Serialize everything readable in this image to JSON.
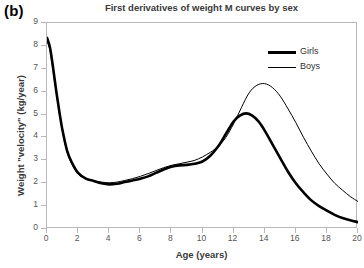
{
  "panel": {
    "label": "(b)"
  },
  "chart_data": {
    "type": "line",
    "title": "First derivatives of weight M curves by sex",
    "xlabel": "Age (years)",
    "ylabel": "Weight \"velocity\" (kg/year)",
    "xlim": [
      0,
      20
    ],
    "ylim": [
      0,
      9
    ],
    "xticks": [
      0,
      2,
      4,
      6,
      8,
      10,
      12,
      14,
      16,
      18,
      20
    ],
    "yticks": [
      0,
      1,
      2,
      3,
      4,
      5,
      6,
      7,
      8,
      9
    ],
    "grid": false,
    "legend_position": "top-right",
    "series": [
      {
        "name": "Girls",
        "color": "#000000",
        "linewidth": 2.6,
        "peak_age": 12.8,
        "peak_value": 5.05,
        "x": [
          0,
          0.2,
          0.4,
          0.6,
          0.8,
          1.0,
          1.3,
          1.6,
          2.0,
          2.5,
          3.0,
          3.5,
          4.0,
          4.5,
          5.0,
          5.5,
          6.0,
          6.5,
          7.0,
          7.5,
          8.0,
          8.5,
          9.0,
          9.5,
          10.0,
          10.5,
          11.0,
          11.5,
          12.0,
          12.4,
          12.8,
          13.2,
          13.6,
          14.0,
          14.5,
          15.0,
          15.5,
          16.0,
          16.5,
          17.0,
          17.5,
          18.0,
          18.5,
          19.0,
          19.5,
          20.0
        ],
        "y": [
          8.35,
          7.9,
          7.0,
          6.0,
          5.1,
          4.3,
          3.4,
          2.9,
          2.45,
          2.2,
          2.1,
          2.0,
          1.95,
          1.98,
          2.05,
          2.12,
          2.2,
          2.3,
          2.45,
          2.6,
          2.72,
          2.78,
          2.8,
          2.85,
          2.95,
          3.2,
          3.6,
          4.15,
          4.7,
          4.95,
          5.05,
          4.95,
          4.7,
          4.3,
          3.7,
          3.1,
          2.5,
          2.0,
          1.6,
          1.25,
          1.0,
          0.8,
          0.62,
          0.48,
          0.38,
          0.3
        ]
      },
      {
        "name": "Boys",
        "color": "#000000",
        "linewidth": 1.0,
        "peak_age": 14.0,
        "peak_value": 6.35,
        "x": [
          0,
          0.2,
          0.4,
          0.6,
          0.8,
          1.0,
          1.3,
          1.6,
          2.0,
          2.5,
          3.0,
          3.5,
          4.0,
          4.5,
          5.0,
          5.5,
          6.0,
          6.5,
          7.0,
          7.5,
          8.0,
          8.5,
          9.0,
          9.5,
          10.0,
          10.5,
          11.0,
          11.5,
          12.0,
          12.5,
          13.0,
          13.5,
          14.0,
          14.5,
          15.0,
          15.5,
          16.0,
          16.5,
          17.0,
          17.5,
          18.0,
          18.5,
          19.0,
          19.5,
          20.0
        ],
        "y": [
          8.2,
          7.8,
          6.9,
          5.95,
          5.05,
          4.25,
          3.35,
          2.85,
          2.4,
          2.2,
          2.1,
          2.05,
          2.02,
          2.05,
          2.12,
          2.2,
          2.3,
          2.42,
          2.55,
          2.68,
          2.78,
          2.85,
          2.92,
          3.0,
          3.15,
          3.35,
          3.6,
          4.0,
          4.6,
          5.3,
          5.95,
          6.28,
          6.35,
          6.18,
          5.8,
          5.25,
          4.65,
          4.0,
          3.4,
          2.85,
          2.4,
          2.0,
          1.7,
          1.42,
          1.2
        ]
      }
    ]
  },
  "legend": {
    "items": [
      {
        "label": "Girls",
        "style": "thick"
      },
      {
        "label": "Boys",
        "style": "thin"
      }
    ]
  }
}
